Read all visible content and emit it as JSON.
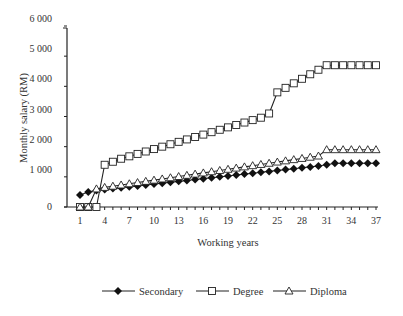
{
  "chart_data": {
    "type": "line",
    "title": "",
    "xlabel": "Working years",
    "ylabel": "Monthly salary (RM)",
    "x_tick_labels": [
      "1",
      "4",
      "7",
      "10",
      "13",
      "16",
      "19",
      "22",
      "25",
      "28",
      "31",
      "34",
      "37"
    ],
    "y_tick_labels": [
      "0",
      "1 000",
      "2 000",
      "3 000",
      "4 000",
      "5 000",
      "6 000"
    ],
    "ylim": [
      0,
      6000
    ],
    "xlim": [
      1,
      37
    ],
    "grid": false,
    "legend_position": "bottom",
    "x": [
      1,
      2,
      3,
      4,
      5,
      6,
      7,
      8,
      9,
      10,
      11,
      12,
      13,
      14,
      15,
      16,
      17,
      18,
      19,
      20,
      21,
      22,
      23,
      24,
      25,
      26,
      27,
      28,
      29,
      30,
      31,
      32,
      33,
      34,
      35,
      36,
      37
    ],
    "series": [
      {
        "name": "Secondary",
        "marker": "diamond-filled",
        "values": [
          400,
          500,
          550,
          580,
          610,
          640,
          670,
          700,
          730,
          760,
          790,
          820,
          850,
          880,
          910,
          940,
          970,
          1000,
          1030,
          1060,
          1090,
          1120,
          1150,
          1180,
          1210,
          1240,
          1270,
          1300,
          1330,
          1360,
          1400,
          1450,
          1450,
          1450,
          1450,
          1450,
          1450
        ]
      },
      {
        "name": "Degree",
        "marker": "square-open",
        "values": [
          0,
          0,
          0,
          1400,
          1500,
          1600,
          1680,
          1760,
          1840,
          1920,
          2000,
          2080,
          2160,
          2240,
          2320,
          2400,
          2480,
          2560,
          2640,
          2720,
          2800,
          2880,
          2960,
          3100,
          3800,
          3950,
          4100,
          4250,
          4400,
          4550,
          4700,
          4700,
          4700,
          4700,
          4700,
          4700,
          4700
        ]
      },
      {
        "name": "Diploma",
        "marker": "triangle-open",
        "values": [
          0,
          0,
          600,
          650,
          690,
          730,
          770,
          810,
          850,
          890,
          930,
          970,
          1010,
          1050,
          1090,
          1130,
          1170,
          1210,
          1250,
          1290,
          1330,
          1370,
          1410,
          1450,
          1490,
          1530,
          1570,
          1610,
          1650,
          1690,
          1900,
          1900,
          1900,
          1900,
          1900,
          1900,
          1900
        ]
      }
    ]
  }
}
